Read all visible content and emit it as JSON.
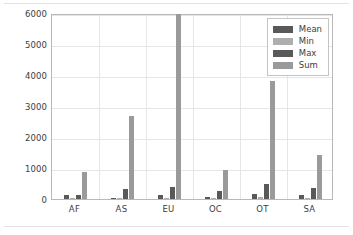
{
  "chart_data": {
    "type": "bar",
    "title": "",
    "xlabel": "",
    "ylabel": "",
    "categories": [
      "AF",
      "AS",
      "EU",
      "OC",
      "OT",
      "SA"
    ],
    "series": [
      {
        "name": "Mean",
        "color": "#595959",
        "values": [
          120,
          45,
          120,
          50,
          175,
          130
        ]
      },
      {
        "name": "Min",
        "color": "#aeaeae",
        "values": [
          5,
          10,
          10,
          5,
          60,
          10
        ]
      },
      {
        "name": "Max",
        "color": "#595959",
        "values": [
          120,
          330,
          390,
          255,
          480,
          350
        ]
      },
      {
        "name": "Sum",
        "color": "#9a9a9a",
        "values": [
          870,
          2670,
          5960,
          950,
          3820,
          1420
        ]
      }
    ],
    "ylim": [
      0,
      6000
    ],
    "yticks": [
      0,
      1000,
      2000,
      3000,
      4000,
      5000,
      6000
    ],
    "ytick_labels": [
      "0",
      "1000",
      "2000",
      "3000",
      "4000",
      "5000",
      "6000"
    ],
    "grid": true,
    "legend_position": "upper right",
    "legend_entries": [
      "Mean",
      "Min",
      "Max",
      "Sum"
    ],
    "background_color": "#ffffff",
    "gridline_color": "#e6e6e6",
    "axis_color": "#b8b8b8"
  }
}
